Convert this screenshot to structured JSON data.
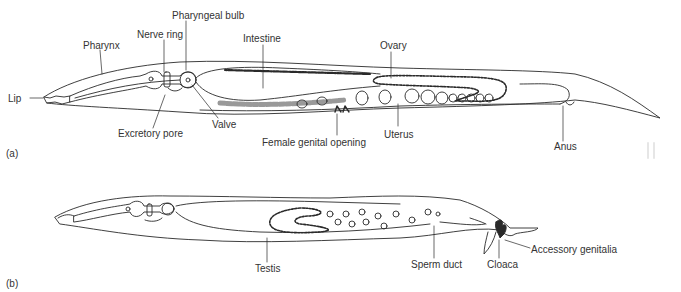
{
  "figure": {
    "panels": [
      {
        "id": "a",
        "tag": "(a)",
        "subject": "female nematode",
        "labels": {
          "lip": "Lip",
          "pharynx": "Pharynx",
          "nerve_ring": "Nerve ring",
          "pharyngeal_bulb": "Pharyngeal bulb",
          "intestine": "Intestine",
          "ovary": "Ovary",
          "excretory_pore": "Excretory pore",
          "valve": "Valve",
          "female_genital_opening": "Female genital opening",
          "uterus": "Uterus",
          "anus": "Anus"
        }
      },
      {
        "id": "b",
        "tag": "(b)",
        "subject": "male nematode",
        "labels": {
          "testis": "Testis",
          "sperm_duct": "Sperm duct",
          "cloaca": "Cloaca",
          "accessory_genitalia": "Accessory genitalia"
        }
      }
    ],
    "colors": {
      "line": "#2a2a2a",
      "background": "#ffffff"
    }
  }
}
